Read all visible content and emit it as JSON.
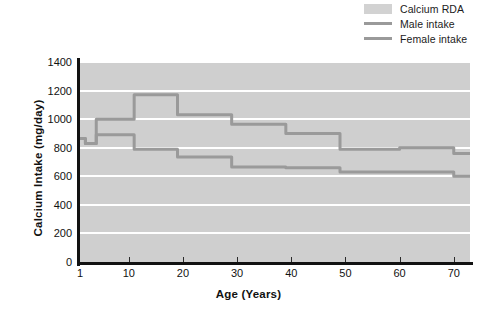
{
  "legend": {
    "position": "top-right",
    "items": [
      {
        "label": "Calcium RDA",
        "key": "band",
        "color": "#d2d2d2",
        "icon": "band-swatch"
      },
      {
        "label": "Male intake",
        "key": "line",
        "color": "#9a9a9a",
        "icon": "line-swatch"
      },
      {
        "label": "Female intake",
        "key": "line",
        "color": "#9a9a9a",
        "icon": "line-swatch"
      }
    ]
  },
  "axes": {
    "x_title": "Age (Years)",
    "y_title": "Calcium Intake (mg/day)",
    "x_ticks": [
      "1",
      "10",
      "20",
      "30",
      "40",
      "50",
      "60",
      "70"
    ],
    "y_ticks": [
      "0",
      "200",
      "400",
      "600",
      "800",
      "1000",
      "1200",
      "1400"
    ]
  },
  "chart_data": {
    "type": "line",
    "title": "",
    "subtitle": "",
    "xlabel": "Age (Years)",
    "ylabel": "Calcium Intake (mg/day)",
    "xlim": [
      1,
      73
    ],
    "ylim": [
      0,
      1400
    ],
    "xticks": [
      1,
      10,
      20,
      30,
      40,
      50,
      60,
      70
    ],
    "yticks": [
      0,
      200,
      400,
      600,
      800,
      1000,
      1200,
      1400
    ],
    "grid": "horizontal-white-lines",
    "legend_position": "top-right",
    "background_band": {
      "name": "Calcium RDA",
      "color": "#d2d2d2",
      "description": "Shaded region spanning full plot area representing the calcium RDA"
    },
    "series": [
      {
        "name": "Male intake",
        "color": "#9a9a9a",
        "step": "post",
        "x": [
          1,
          2,
          3,
          4,
          5,
          9,
          10,
          11,
          18,
          19,
          28,
          29,
          38,
          39,
          48,
          49,
          59,
          60,
          69,
          70,
          73
        ],
        "values": [
          865,
          830,
          830,
          1000,
          1000,
          1000,
          1000,
          1170,
          1170,
          1030,
          1030,
          965,
          965,
          900,
          900,
          790,
          790,
          800,
          800,
          760,
          760
        ]
      },
      {
        "name": "Female intake",
        "color": "#9a9a9a",
        "step": "post",
        "x": [
          1,
          2,
          3,
          4,
          5,
          9,
          10,
          11,
          18,
          19,
          28,
          29,
          38,
          39,
          48,
          49,
          59,
          60,
          69,
          70,
          73
        ],
        "values": [
          865,
          830,
          830,
          890,
          890,
          890,
          890,
          790,
          790,
          735,
          735,
          665,
          665,
          660,
          660,
          630,
          630,
          630,
          630,
          600,
          600
        ]
      }
    ]
  }
}
